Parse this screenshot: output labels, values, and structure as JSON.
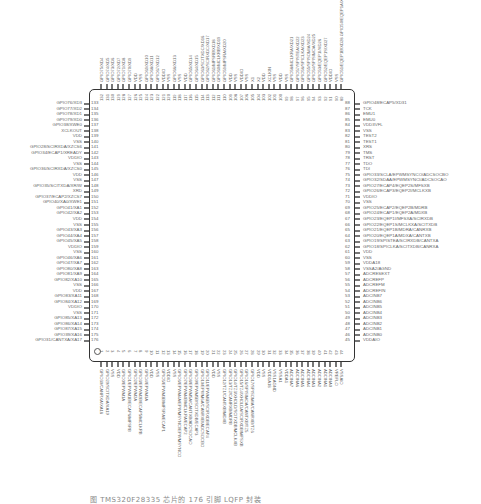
{
  "figure": {
    "caption": "图 TMS320F28335 芯片的 176 引脚 LQFP 封装",
    "package_pins": 176
  },
  "left_pins": [
    {
      "num": "133",
      "label": "GPIO76/XD3"
    },
    {
      "num": "134",
      "label": "GPIO77/XD2"
    },
    {
      "num": "135",
      "label": "GPIO78/XD1"
    },
    {
      "num": "136",
      "label": "GPIO79/XD0"
    },
    {
      "num": "137",
      "label": "GPIO38/XWE0"
    },
    {
      "num": "138",
      "label": "XCLKOUT"
    },
    {
      "num": "139",
      "label": "VDD"
    },
    {
      "num": "140",
      "label": "VSS"
    },
    {
      "num": "141",
      "label": "GPIO28/SCIRXDA/XZCS6"
    },
    {
      "num": "142",
      "label": "GPIO34/ECAP1/XREADY"
    },
    {
      "num": "143",
      "label": "VDDIO"
    },
    {
      "num": "144",
      "label": "VSS"
    },
    {
      "num": "145",
      "label": "GPIO36/SCIRXDA/XZCS0"
    },
    {
      "num": "146",
      "label": "VDD"
    },
    {
      "num": "147",
      "label": "VSS"
    },
    {
      "num": "148",
      "label": "GPIO35/SCITXDA/XR/W"
    },
    {
      "num": "149",
      "label": "XRD"
    },
    {
      "num": "150",
      "label": "GPIO37/ECAP2/XZCS7"
    },
    {
      "num": "151",
      "label": "GPIO40/XA0/XWE1"
    },
    {
      "num": "152",
      "label": "GPIO41/XA1"
    },
    {
      "num": "153",
      "label": "GPIO42/XA2"
    },
    {
      "num": "154",
      "label": "VDD"
    },
    {
      "num": "155",
      "label": "VSS"
    },
    {
      "num": "156",
      "label": "GPIO43/XA3"
    },
    {
      "num": "157",
      "label": "GPIO44/XA4"
    },
    {
      "num": "158",
      "label": "GPIO45/XA5"
    },
    {
      "num": "159",
      "label": "VDDIO"
    },
    {
      "num": "160",
      "label": "VSS"
    },
    {
      "num": "161",
      "label": "GPIO46/XA6"
    },
    {
      "num": "162",
      "label": "GPIO47/XA7"
    },
    {
      "num": "163",
      "label": "GPIO80/XA8"
    },
    {
      "num": "164",
      "label": "GPIO81/XA9"
    },
    {
      "num": "165",
      "label": "GPIO82/XA10"
    },
    {
      "num": "166",
      "label": "VSS"
    },
    {
      "num": "167",
      "label": "VDD"
    },
    {
      "num": "168",
      "label": "GPIO83/XA11"
    },
    {
      "num": "169",
      "label": "GPIO84/XA12"
    },
    {
      "num": "170",
      "label": "VDDIO"
    },
    {
      "num": "171",
      "label": "VSS"
    },
    {
      "num": "172",
      "label": "GPIO85/XA13"
    },
    {
      "num": "173",
      "label": "GPIO86/XA14"
    },
    {
      "num": "174",
      "label": "GPIO87/XA15"
    },
    {
      "num": "175",
      "label": "GPIO39/XA16"
    },
    {
      "num": "176",
      "label": "GPIO31/CANTXA/XA17"
    }
  ],
  "right_pins": [
    {
      "num": "88",
      "label": "GPIO48/ECAP5/XD31"
    },
    {
      "num": "87",
      "label": "TCK"
    },
    {
      "num": "86",
      "label": "EMU1"
    },
    {
      "num": "85",
      "label": "EMU0"
    },
    {
      "num": "84",
      "label": "VDD3VFL"
    },
    {
      "num": "83",
      "label": "VSS"
    },
    {
      "num": "82",
      "label": "TEST2"
    },
    {
      "num": "81",
      "label": "TEST1"
    },
    {
      "num": "80",
      "label": "XRS"
    },
    {
      "num": "79",
      "label": "TMS"
    },
    {
      "num": "78",
      "label": "TRST"
    },
    {
      "num": "77",
      "label": "TDO"
    },
    {
      "num": "76",
      "label": "TDI"
    },
    {
      "num": "75",
      "label": "GPIO33/SCLA/EPWMSYNCO/ADCSOCBO"
    },
    {
      "num": "74",
      "label": "GPIO32/SDAA/EPWMSYNCI/ADCSOCAO"
    },
    {
      "num": "73",
      "label": "GPIO27/ECAP4/EQEP2S/MFSXB"
    },
    {
      "num": "72",
      "label": "GPIO26/ECAP3/EQEP2I/MCLKXB"
    },
    {
      "num": "71",
      "label": "VDDIO"
    },
    {
      "num": "70",
      "label": "VSS"
    },
    {
      "num": "69",
      "label": "GPIO25/ECAP2/EQEP2B/MDRB"
    },
    {
      "num": "68",
      "label": "GPIO24/ECAP1/EQEP2A/MDXB"
    },
    {
      "num": "67",
      "label": "GPIO23/EQEP1I/MFSXA/SCIRXDB"
    },
    {
      "num": "66",
      "label": "GPIO22/EQEP1S/MCLKXA/SCITXDB"
    },
    {
      "num": "65",
      "label": "GPIO21/EQEP1B/MDRA/CANRXB"
    },
    {
      "num": "64",
      "label": "GPIO20/EQEP1A/MDXA/CANTXB"
    },
    {
      "num": "63",
      "label": "GPIO19/SPISTEA/SCIRXDB/CANTXA"
    },
    {
      "num": "62",
      "label": "GPIO18/SPICLKA/SCITXDB/CANRXA"
    },
    {
      "num": "61",
      "label": "VDD"
    },
    {
      "num": "60",
      "label": "VSS"
    },
    {
      "num": "59",
      "label": "VDDA18"
    },
    {
      "num": "58",
      "label": "VSSA2/AGND"
    },
    {
      "num": "57",
      "label": "ADCRESEXT"
    },
    {
      "num": "56",
      "label": "ADCREFP"
    },
    {
      "num": "55",
      "label": "ADCREFM"
    },
    {
      "num": "54",
      "label": "ADCREFIN"
    },
    {
      "num": "53",
      "label": "ADCINB7"
    },
    {
      "num": "52",
      "label": "ADCINB6"
    },
    {
      "num": "51",
      "label": "ADCINB5"
    },
    {
      "num": "50",
      "label": "ADCINB4"
    },
    {
      "num": "49",
      "label": "ADCINB3"
    },
    {
      "num": "48",
      "label": "ADCINB2"
    },
    {
      "num": "47",
      "label": "ADCINB1"
    },
    {
      "num": "46",
      "label": "ADCINB0"
    },
    {
      "num": "45",
      "label": "VDDAIO"
    }
  ],
  "top_pins": [
    {
      "num": "132",
      "label": "GPIO75/XD4"
    },
    {
      "num": "131",
      "label": "GPIO74/XD5"
    },
    {
      "num": "130",
      "label": "GPIO73/XD6"
    },
    {
      "num": "129",
      "label": "GPIO72/XD7"
    },
    {
      "num": "128",
      "label": "GPIO71/XD8"
    },
    {
      "num": "127",
      "label": "GPIO70/XD9"
    },
    {
      "num": "126",
      "label": "VDD"
    },
    {
      "num": "125",
      "label": "VSS"
    },
    {
      "num": "124",
      "label": "GPIO69/XD10"
    },
    {
      "num": "123",
      "label": "GPIO68/XD11"
    },
    {
      "num": "122",
      "label": "GPIO67/XD12"
    },
    {
      "num": "121",
      "label": "VDDIO"
    },
    {
      "num": "120",
      "label": "VSS"
    },
    {
      "num": "119",
      "label": "GPIO66/XD13"
    },
    {
      "num": "118",
      "label": "VSS"
    },
    {
      "num": "117",
      "label": "VDD"
    },
    {
      "num": "116",
      "label": "GPIO65/XD14"
    },
    {
      "num": "115",
      "label": "GPIO64/XD15"
    },
    {
      "num": "114",
      "label": "GPIO63/SCITXDC/XD16"
    },
    {
      "num": "113",
      "label": "GPIO62/SCIRXDC/XD17"
    },
    {
      "num": "112",
      "label": "GPIO61/MFSRB/XD18"
    },
    {
      "num": "111",
      "label": "GPIO60/MCLKRB/XD19"
    },
    {
      "num": "110",
      "label": "GPIO59/MFSRA/XD20"
    },
    {
      "num": "109",
      "label": "VDD"
    },
    {
      "num": "108",
      "label": "VSS"
    },
    {
      "num": "107",
      "label": "VDDIO"
    },
    {
      "num": "106",
      "label": "VSS"
    },
    {
      "num": "105",
      "label": "X1"
    },
    {
      "num": "104",
      "label": "X2"
    },
    {
      "num": "103",
      "label": "VDD"
    },
    {
      "num": "102",
      "label": "XCLKIN"
    },
    {
      "num": "101",
      "label": "VSS"
    },
    {
      "num": "100",
      "label": "VDD"
    },
    {
      "num": "99",
      "label": "VSS"
    },
    {
      "num": "98",
      "label": "GPIO58/MCLKRA/XD21"
    },
    {
      "num": "97",
      "label": "GPIO57/SPISTEA/XD22"
    },
    {
      "num": "96",
      "label": "GPIO56/SPICLKA/XD23"
    },
    {
      "num": "95",
      "label": "GPIO55/SPISOMIA/XD24"
    },
    {
      "num": "94",
      "label": "GPIO54/SPISIMOA/XD25"
    },
    {
      "num": "93",
      "label": "GPIO53/EQEP1I/XD26"
    },
    {
      "num": "92",
      "label": "GPIO52/EQEP1S/XD27"
    },
    {
      "num": "91",
      "label": "VDDIO"
    },
    {
      "num": "90",
      "label": "VSS"
    },
    {
      "num": "89",
      "label": "GPIO51/EQEP1B/XD28 GPIO50/EQEP1A/XD29 GPIO49/ECAP6/XD30"
    }
  ],
  "bottom_pins": [
    {
      "num": "1",
      "label": "GPIO30/CANRXA/XA18"
    },
    {
      "num": "2",
      "label": "GPIO29/SCITXDA/XA19"
    },
    {
      "num": "3",
      "label": "VSS"
    },
    {
      "num": "4",
      "label": "VDD"
    },
    {
      "num": "5",
      "label": "GPIO0/EPWM1A"
    },
    {
      "num": "6",
      "label": "GPIO1/EPWM1B/ECAP6/MFSRB"
    },
    {
      "num": "7",
      "label": "GPIO2/EPWM2A"
    },
    {
      "num": "8",
      "label": "GPIO3/EPWM2B/ECAP5/MCLKRB"
    },
    {
      "num": "9",
      "label": "GPIO4/EPWM3A"
    },
    {
      "num": "10",
      "label": "VDD"
    },
    {
      "num": "11",
      "label": "VSS"
    },
    {
      "num": "12",
      "label": "GPIO5/EPWM3B/MFSRA/ECAP1"
    },
    {
      "num": "13",
      "label": "VDDIO"
    },
    {
      "num": "14",
      "label": "VSS"
    },
    {
      "num": "15",
      "label": "GPIO6/EPWM4A/EPWMSYNCI/EPWMSYNCO"
    },
    {
      "num": "16",
      "label": "GPIO7/EPWM4B/MCLKRA/ECAP2"
    },
    {
      "num": "17",
      "label": "GPIO8/EPWM5A/CANTXB/ADCSOCAO"
    },
    {
      "num": "18",
      "label": "GPIO9/EPWM5B/SCITXDB/ECAP3"
    },
    {
      "num": "19",
      "label": "GPIO10/EPWM6A/CANRXB/ADCSOCBO"
    },
    {
      "num": "20",
      "label": "GPIO11/EPWM6B/SCIRXDB/ECAP4"
    },
    {
      "num": "21",
      "label": "VDD"
    },
    {
      "num": "22",
      "label": "VSS"
    },
    {
      "num": "23",
      "label": "GPIO12/TZ1/CANTXB/MDXB"
    },
    {
      "num": "24",
      "label": "GPIO13/TZ2/CANRXB/MDRB"
    },
    {
      "num": "25",
      "label": "GPIO14/TZ3/XHOLD/SCITXDB/MCLKXB"
    },
    {
      "num": "26",
      "label": "GPIO15/TZ4/XHOLDA/SCIRXDB/MFSXB"
    },
    {
      "num": "27",
      "label": "GPIO16/SPISIMOA/CANTXB/TZ5"
    },
    {
      "num": "28",
      "label": "GPIO17/SPISOMIA/CANRXB/TZ6"
    },
    {
      "num": "29",
      "label": "VDD"
    },
    {
      "num": "30",
      "label": "VSS"
    },
    {
      "num": "31",
      "label": "VDD1A18"
    },
    {
      "num": "32",
      "label": "VSS1AGND"
    },
    {
      "num": "33",
      "label": "VSSA1"
    },
    {
      "num": "34",
      "label": "VDDA1"
    },
    {
      "num": "35",
      "label": "ADCINA7"
    },
    {
      "num": "36",
      "label": "ADCINA6"
    },
    {
      "num": "37",
      "label": "ADCINA5"
    },
    {
      "num": "38",
      "label": "ADCINA4"
    },
    {
      "num": "39",
      "label": "ADCINA3"
    },
    {
      "num": "40",
      "label": "ADCINA2"
    },
    {
      "num": "41",
      "label": "ADCINA1"
    },
    {
      "num": "42",
      "label": "ADCINA0"
    },
    {
      "num": "43",
      "label": "VREFLO"
    },
    {
      "num": "44",
      "label": "VSSAIO"
    }
  ]
}
